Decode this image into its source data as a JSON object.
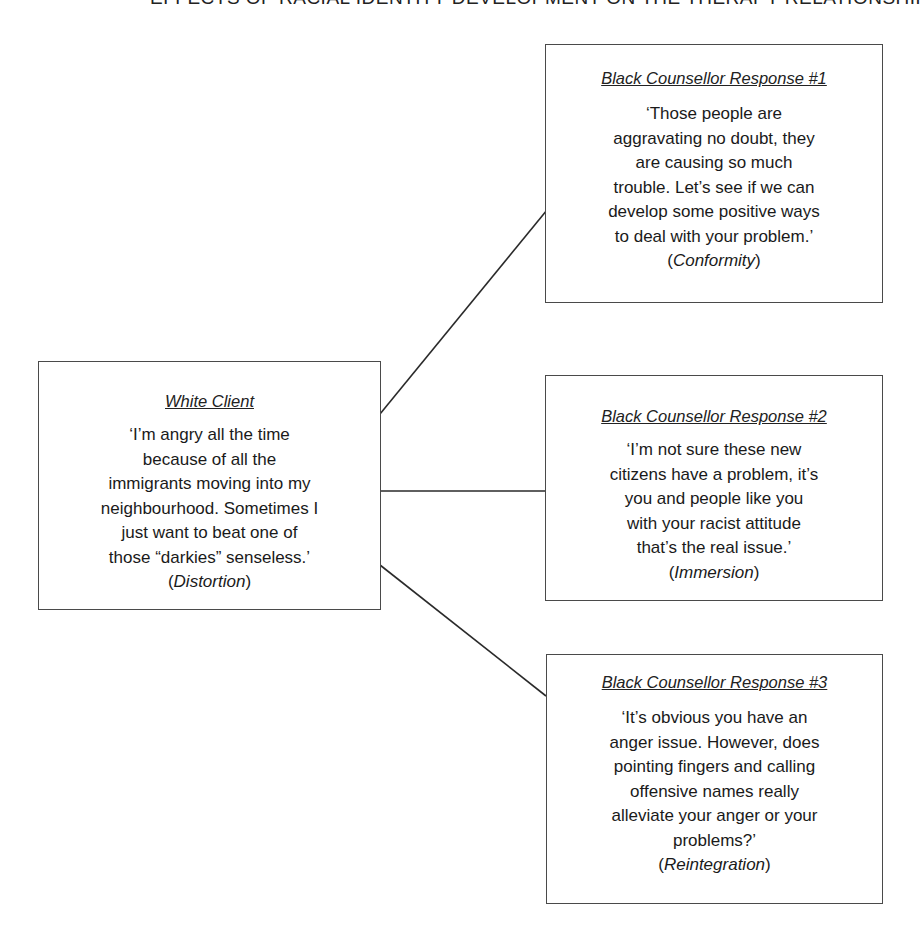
{
  "heading": {
    "text": "EFFECTS OF RACIAL IDENTITY DEVELOPMENT ON THE THERAPY RELATIONSHIP"
  },
  "client": {
    "title": "White Client",
    "quote_lines": [
      "‘I’m angry all the time",
      "because of all the",
      "immigrants moving into my",
      "neighbourhood. Sometimes I",
      "just want to beat one of",
      "those “darkies” senseless.’"
    ],
    "stage": "Distortion"
  },
  "responses": [
    {
      "title": "Black Counsellor Response #1",
      "quote_lines": [
        "‘Those people are",
        "aggravating no doubt, they",
        "are causing so much",
        "trouble. Let’s see if we can",
        "develop some positive ways",
        "to deal with your problem.’"
      ],
      "stage": "Conformity"
    },
    {
      "title": "Black Counsellor Response #2",
      "quote_lines": [
        "‘I’m not sure these new",
        "citizens have a problem, it’s",
        "you and people like you",
        "with your racist attitude",
        "that’s the real issue.’"
      ],
      "stage": "Immersion"
    },
    {
      "title": "Black Counsellor Response #3",
      "quote_lines": [
        "‘It’s obvious you have an",
        "anger issue. However, does",
        "pointing fingers and calling",
        "offensive names really",
        "alleviate your anger or your",
        "problems?’"
      ],
      "stage": "Reintegration"
    }
  ],
  "punctuation": {
    "open_paren": "(",
    "close_paren": ")"
  },
  "colors": {
    "line": "#2a2a2a",
    "border": "#4a4a4a",
    "text": "#1a1a1a"
  }
}
